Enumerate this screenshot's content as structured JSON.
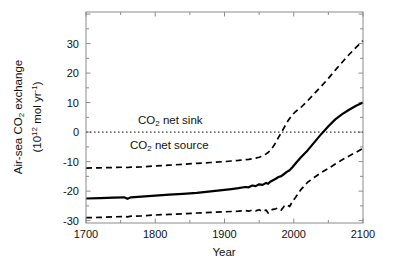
{
  "figure": {
    "background": "#ffffff",
    "xlabel": "Year",
    "ylabel": {
      "line1": {
        "pre": "Air-sea CO",
        "sub": "2",
        "post": " exchange"
      },
      "line2": {
        "pre": "(10",
        "sup": "12",
        "mid": " mol yr",
        "sup2": "-1",
        "post": ")"
      }
    },
    "annotations": {
      "net_sink": {
        "pre": "CO",
        "sub": "2",
        "post": " net sink"
      },
      "net_source": {
        "pre": "CO",
        "sub": "2",
        "post": " net source"
      }
    }
  },
  "chart_data": {
    "type": "line",
    "title": "",
    "xlabel": "Year",
    "ylabel": "Air-sea CO2 exchange (10^12 mol yr^-1)",
    "xlim": [
      1700,
      2100
    ],
    "ylim": [
      -30.8,
      40.7
    ],
    "x_ticks": [
      1700,
      1800,
      1900,
      2000,
      2100
    ],
    "y_ticks": [
      30,
      20,
      10,
      0,
      -10,
      -20,
      -30
    ],
    "x_minor_step": 50,
    "y_minor_step": 5,
    "grid": false,
    "legend": "none",
    "zero_line": {
      "y": 0,
      "style": "dotted"
    },
    "colors": {
      "curves": "#000000",
      "frame": "#8c8c8c",
      "labels": "#111111"
    },
    "x": [
      1700,
      1720,
      1740,
      1755,
      1760,
      1765,
      1780,
      1800,
      1820,
      1840,
      1860,
      1880,
      1900,
      1910,
      1920,
      1930,
      1935,
      1940,
      1945,
      1950,
      1955,
      1960,
      1963,
      1966,
      1970,
      1974,
      1978,
      1982,
      1986,
      1990,
      1994,
      1998,
      2002,
      2006,
      2010,
      2020,
      2030,
      2040,
      2050,
      2060,
      2070,
      2080,
      2090,
      2100
    ],
    "series": [
      {
        "name": "central estimate",
        "style": "solid",
        "values": [
          -22.5,
          -22.4,
          -22.2,
          -22.1,
          -22.6,
          -22.1,
          -21.9,
          -21.5,
          -21.2,
          -20.9,
          -20.6,
          -20.1,
          -19.6,
          -19.3,
          -19.0,
          -18.6,
          -18.7,
          -18.1,
          -18.3,
          -17.7,
          -17.9,
          -17.2,
          -17.5,
          -16.8,
          -16.3,
          -15.8,
          -15.2,
          -14.9,
          -14.2,
          -13.5,
          -12.9,
          -11.9,
          -10.8,
          -9.7,
          -8.6,
          -6.2,
          -3.4,
          -0.6,
          2.0,
          4.3,
          6.1,
          7.6,
          8.9,
          10.0
        ]
      },
      {
        "name": "upper uncertainty bound",
        "style": "dashed",
        "values": [
          -12.2,
          -12.1,
          -12.0,
          -11.9,
          -12.0,
          -11.9,
          -11.8,
          -11.5,
          -11.2,
          -10.9,
          -10.6,
          -10.3,
          -10.0,
          -9.8,
          -9.6,
          -9.3,
          -9.2,
          -9.0,
          -8.8,
          -8.5,
          -8.1,
          -7.4,
          -6.9,
          -6.2,
          -5.0,
          -3.6,
          -1.8,
          -0.2,
          1.5,
          3.2,
          4.6,
          5.8,
          6.8,
          7.6,
          8.3,
          10.6,
          13.1,
          15.6,
          18.2,
          21.0,
          23.7,
          26.3,
          28.7,
          31.0
        ]
      },
      {
        "name": "lower uncertainty bound",
        "style": "dashed",
        "values": [
          -29.0,
          -28.9,
          -28.7,
          -28.6,
          -28.7,
          -28.5,
          -28.4,
          -28.1,
          -27.9,
          -27.7,
          -27.4,
          -27.2,
          -27.0,
          -26.9,
          -26.8,
          -26.6,
          -26.8,
          -26.4,
          -26.7,
          -26.3,
          -26.9,
          -26.4,
          -27.4,
          -26.5,
          -26.2,
          -26.0,
          -25.7,
          -26.4,
          -25.1,
          -24.6,
          -25.2,
          -23.5,
          -22.3,
          -21.0,
          -19.6,
          -17.0,
          -15.3,
          -13.7,
          -12.3,
          -10.8,
          -9.4,
          -8.1,
          -6.8,
          -5.5
        ]
      }
    ]
  }
}
